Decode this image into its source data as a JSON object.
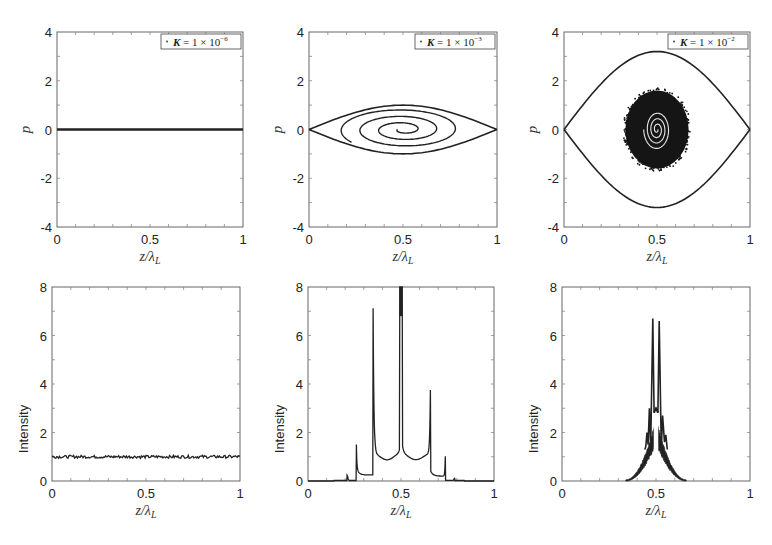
{
  "figure": {
    "rows": 2,
    "cols": 3
  },
  "chart_data": [
    {
      "id": "phase-k1e-6",
      "type": "scatter",
      "title": "",
      "legend": "K = 1 × 10^-6",
      "legend_text": {
        "k": "K",
        "eq": " = 1 × 10",
        "exp": "−6"
      },
      "xlabel": "z/λL",
      "ylabel": "p",
      "xlim": [
        0,
        1
      ],
      "ylim": [
        -4,
        4
      ],
      "xticks": [
        "0",
        "0.5",
        "1"
      ],
      "yticks": [
        "-4",
        "-2",
        "0",
        "2",
        "4"
      ],
      "grid": false,
      "description": "All particles lie on a flat line at p ≈ 0 across z/λL ∈ [0,1]",
      "series": [
        {
          "name": "particles",
          "x": [
            0,
            0.25,
            0.5,
            0.75,
            1
          ],
          "y": [
            0,
            0,
            0,
            0,
            0
          ]
        }
      ]
    },
    {
      "id": "phase-k1e-3",
      "type": "scatter",
      "legend": "K = 1 × 10^-3",
      "legend_text": {
        "k": "K",
        "eq": " = 1 × 10",
        "exp": "−3"
      },
      "xlabel": "z/λL",
      "ylabel": "p",
      "xlim": [
        0,
        1
      ],
      "ylim": [
        -4,
        4
      ],
      "xticks": [
        "0",
        "0.5",
        "1"
      ],
      "yticks": [
        "-4",
        "-2",
        "0",
        "2",
        "4"
      ],
      "grid": false,
      "description": "Separatrix eye from z=0 to z=1 with max |p| ≈ 1.0 at z=0.5; interior spiral with ~3 turns",
      "separatrix_pmax": 1.0
    },
    {
      "id": "phase-k1e-2",
      "type": "scatter",
      "legend": "K = 1 × 10^-2",
      "legend_text": {
        "k": "K",
        "eq": " = 1 × 10",
        "exp": "−2"
      },
      "xlabel": "z/λL",
      "ylabel": "p",
      "xlim": [
        0,
        1
      ],
      "ylim": [
        -4,
        4
      ],
      "xticks": [
        "0",
        "0.5",
        "1"
      ],
      "yticks": [
        "-4",
        "-2",
        "0",
        "2",
        "4"
      ],
      "grid": false,
      "description": "Large separatrix with max |p| ≈ 3.2 at z=0.5; dense particle blob centered at (0.5, 0) spanning z≈0.33–0.67, p≈-1.6–1.6 with tight inner spiral",
      "separatrix_pmax": 3.2,
      "blob": {
        "cx": 0.5,
        "cy": 0,
        "rx": 0.17,
        "ry": 1.6
      }
    },
    {
      "id": "intensity-k1e-6",
      "type": "line",
      "xlabel": "z/λL",
      "ylabel": "Intensity",
      "xlim": [
        0,
        1
      ],
      "ylim": [
        0,
        8
      ],
      "xticks": [
        "0",
        "0.5",
        "1"
      ],
      "yticks": [
        "0",
        "2",
        "4",
        "6",
        "8"
      ],
      "grid": false,
      "description": "Nearly uniform noisy intensity ≈ 1.0 across full range",
      "series": [
        {
          "name": "intensity",
          "x": [
            0,
            0.1,
            0.2,
            0.3,
            0.4,
            0.5,
            0.6,
            0.7,
            0.8,
            0.9,
            1.0
          ],
          "y": [
            1.0,
            0.98,
            1.03,
            1.0,
            0.99,
            1.0,
            1.01,
            0.99,
            1.0,
            0.98,
            1.0
          ]
        }
      ]
    },
    {
      "id": "intensity-k1e-3",
      "type": "line",
      "xlabel": "z/λL",
      "ylabel": "Intensity",
      "xlim": [
        0,
        1
      ],
      "ylim": [
        0,
        8
      ],
      "xticks": [
        "0",
        "0.5",
        "1"
      ],
      "yticks": [
        "0",
        "2",
        "4",
        "6",
        "8"
      ],
      "grid": false,
      "description": "Symmetric spike structure: small spikes near 0.21/0.79, spikes at 0.26 (≈1.5) and 0.74 (≈1.9), large spikes at 0.35 (≈7.0) and 0.66 (≈5.2), central spike at 0.5 exceeding 8 (clipped)",
      "peaks": [
        {
          "x": 0.21,
          "y": 0.25
        },
        {
          "x": 0.26,
          "y": 1.5
        },
        {
          "x": 0.35,
          "y": 7.0
        },
        {
          "x": 0.5,
          "y": 8.0
        },
        {
          "x": 0.66,
          "y": 5.2
        },
        {
          "x": 0.74,
          "y": 1.9
        },
        {
          "x": 0.79,
          "y": 0.15
        }
      ],
      "support": [
        0.14,
        0.84
      ]
    },
    {
      "id": "intensity-k1e-2",
      "type": "line",
      "xlabel": "z/λL",
      "ylabel": "Intensity",
      "xlim": [
        0,
        1
      ],
      "ylim": [
        0,
        8
      ],
      "xticks": [
        "0",
        "0.5",
        "1"
      ],
      "yticks": [
        "0",
        "2",
        "4",
        "6",
        "8"
      ],
      "grid": false,
      "description": "Noisy triangular envelope from 0.34 to 0.66 with twin spikes ≈6.7 at z≈0.48 and 0.52, central plateau ≈2.9, side spikes ≈3.0 at 0.46 and ≈2.7 at 0.54",
      "peaks": [
        {
          "x": 0.46,
          "y": 3.0
        },
        {
          "x": 0.48,
          "y": 6.7
        },
        {
          "x": 0.5,
          "y": 2.9
        },
        {
          "x": 0.52,
          "y": 6.6
        },
        {
          "x": 0.54,
          "y": 2.7
        }
      ],
      "support": [
        0.34,
        0.66
      ]
    }
  ]
}
